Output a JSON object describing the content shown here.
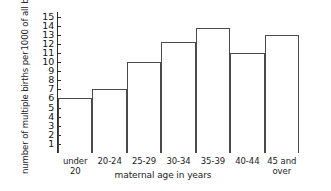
{
  "chart_data": {
    "type": "bar",
    "title": "",
    "xlabel": "maternal age in years",
    "ylabel": "number of multiple births per 1000 of all births",
    "ylabel_lines": [
      "number of multiple births per",
      "1000 of all births"
    ],
    "categories": [
      "under 20",
      "20-24",
      "25-29",
      "30-34",
      "35-39",
      "40-44",
      "45 and over"
    ],
    "category_lines": [
      [
        "under 20"
      ],
      [
        "20-24"
      ],
      [
        "25-29"
      ],
      [
        "30-34"
      ],
      [
        "35-39"
      ],
      [
        "40-44"
      ],
      [
        "45 and",
        "over"
      ]
    ],
    "values": [
      6,
      7,
      10,
      12.2,
      13.7,
      11,
      13
    ],
    "ylim": [
      0,
      15.5
    ],
    "yticks": [
      1,
      2,
      3,
      4,
      5,
      6,
      7,
      8,
      9,
      10,
      11,
      12,
      13,
      14,
      15
    ],
    "ytick_labels": [
      "1",
      "2",
      "3",
      "4",
      "5",
      "6",
      "7",
      "8",
      "9",
      "10",
      "11",
      "12",
      "13",
      "14",
      "15"
    ],
    "grid": false,
    "legend": false,
    "bar_style": "histogram-contiguous-outline",
    "colors": {
      "background": "#ffffff",
      "axis": "#2b2b2b",
      "bar_outline": "#4a4a4a",
      "bar_fill": "transparent",
      "text": "#1c1c1c"
    }
  }
}
